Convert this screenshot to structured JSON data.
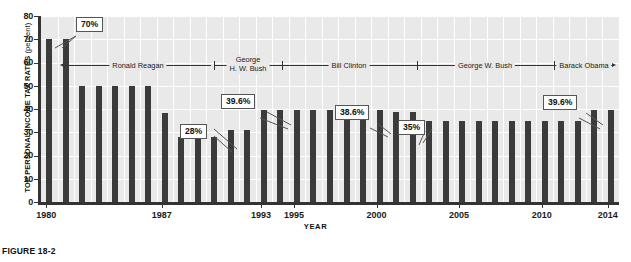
{
  "chart_data": {
    "type": "bar",
    "title": "",
    "xlabel": "YEAR",
    "ylabel": "TOP PERSONAL INCOME TAX RATES",
    "ylabel_unit": "(percent)",
    "ylim": [
      0,
      80
    ],
    "ytick_values": [
      0,
      10,
      20,
      30,
      40,
      50,
      60,
      70,
      80
    ],
    "ytick_labels": [
      "0",
      "10",
      "20",
      "30",
      "40",
      "50",
      "60",
      "70",
      "80"
    ],
    "xtick_labels": [
      "1980",
      "1987",
      "1993",
      "1995",
      "2000",
      "2005",
      "2010",
      "2014"
    ],
    "grid": true,
    "legend": "none",
    "bar_color": "#3b3b3b",
    "plot_background": "#e9e9e9",
    "categories": [
      "1980",
      "1981",
      "1982",
      "1983",
      "1984",
      "1985",
      "1986",
      "1987",
      "1988",
      "1989",
      "1990",
      "1991",
      "1992",
      "1993",
      "1994",
      "1995",
      "1996",
      "1997",
      "1998",
      "1999",
      "2000",
      "2001",
      "2002",
      "2003",
      "2004",
      "2005",
      "2006",
      "2007",
      "2008",
      "2009",
      "2010",
      "2011",
      "2012",
      "2013",
      "2014"
    ],
    "values": [
      70,
      70,
      50,
      50,
      50,
      50,
      50,
      38.5,
      28,
      28,
      28,
      31,
      31,
      39.6,
      39.6,
      39.6,
      39.6,
      39.6,
      39.6,
      39.6,
      39.6,
      38.6,
      38.6,
      35,
      35,
      35,
      35,
      35,
      35,
      35,
      35,
      35,
      35,
      39.6,
      39.6
    ],
    "annotations": [
      {
        "label": "70%",
        "value": 70,
        "year": "1980"
      },
      {
        "label": "28%",
        "value": 28,
        "year": "1990"
      },
      {
        "label": "39.6%",
        "value": 39.6,
        "year": "1993"
      },
      {
        "label": "38.6%",
        "value": 38.6,
        "year": "2002"
      },
      {
        "label": "35%",
        "value": 35,
        "year": "2003"
      },
      {
        "label": "39.6%",
        "value": 39.6,
        "year": "2013"
      }
    ],
    "eras": [
      {
        "name": "Ronald Reagan",
        "start": "1981",
        "end": "1988"
      },
      {
        "name": "George H. W. Bush",
        "name_line1": "George",
        "name_line2": "H. W. Bush",
        "start": "1989",
        "end": "1992"
      },
      {
        "name": "Bill Clinton",
        "start": "1993",
        "end": "2000"
      },
      {
        "name": "George W. Bush",
        "start": "2001",
        "end": "2008"
      },
      {
        "name": "Barack Obama",
        "start": "2009",
        "end": "2014"
      }
    ]
  },
  "annotations": {
    "a0": "70%",
    "a1": "28%",
    "a2": "39.6%",
    "a3": "38.6%",
    "a4": "35%",
    "a5": "39.6%"
  },
  "axes": {
    "y_title_main": "TOP PERSONAL INCOME TAX RATES",
    "y_title_unit": " (percent)",
    "x_title": "YEAR",
    "y0": "0",
    "y10": "10",
    "y20": "20",
    "y30": "30",
    "y40": "40",
    "y50": "50",
    "y60": "60",
    "y70": "70",
    "y80": "80",
    "x1980": "1980",
    "x1987": "1987",
    "x1993": "1993",
    "x1995": "1995",
    "x2000": "2000",
    "x2005": "2005",
    "x2010": "2010",
    "x2014": "2014"
  },
  "eras": {
    "reagan": "Ronald Reagan",
    "ghwbush_line1": "George",
    "ghwbush_line2": "H. W. Bush",
    "clinton": "Bill Clinton",
    "gwbush": "George W. Bush",
    "obama": "Barack Obama"
  },
  "caption": {
    "figure_number": "FIGURE 18-2"
  }
}
